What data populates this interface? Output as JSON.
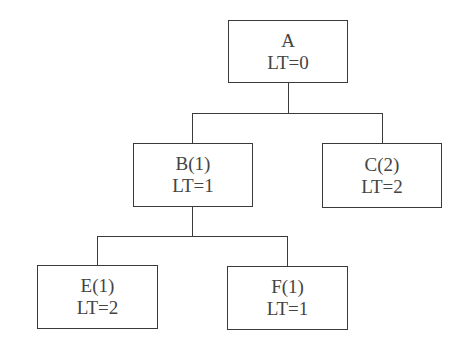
{
  "diagram": {
    "type": "tree",
    "nodes": {
      "A": {
        "label": "A",
        "lt": "LT=0"
      },
      "B": {
        "label": "B(1)",
        "lt": "LT=1"
      },
      "C": {
        "label": "C(2)",
        "lt": "LT=2"
      },
      "E": {
        "label": "E(1)",
        "lt": "LT=2"
      },
      "F": {
        "label": "F(1)",
        "lt": "LT=1"
      }
    },
    "edges": [
      [
        "A",
        "B"
      ],
      [
        "A",
        "C"
      ],
      [
        "B",
        "E"
      ],
      [
        "B",
        "F"
      ]
    ]
  }
}
